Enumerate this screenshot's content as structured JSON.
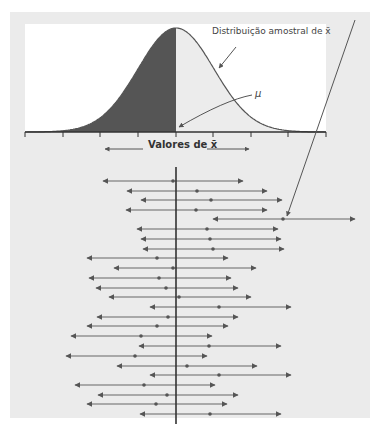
{
  "labels": {
    "dist_label": "Distribuição amostral de x̄",
    "mu_label": "μ",
    "axis_label": "Valores de x̄"
  },
  "colors": {
    "panel": "#ebebeb",
    "curve_box": "#ffffff",
    "shaded": "#555555",
    "unshaded": "#ececec",
    "line": "#555555"
  },
  "curve": {
    "center_x": 176,
    "peak_y": 28,
    "base_y": 132,
    "sigma_px": 38,
    "ticks_x": [
      25,
      63,
      100,
      138,
      176,
      213,
      251,
      288,
      326
    ]
  },
  "mean_line": {
    "x": 176,
    "y1": 167,
    "y2": 424
  },
  "outlier_pointer": {
    "from": [
      355,
      20
    ],
    "to": [
      287,
      216
    ]
  },
  "intervals": [
    {
      "y": 181,
      "left": 103,
      "center": 173,
      "right": 243
    },
    {
      "y": 191,
      "left": 127,
      "center": 197,
      "right": 267
    },
    {
      "y": 200,
      "left": 141,
      "center": 211,
      "right": 282
    },
    {
      "y": 210,
      "left": 126,
      "center": 196,
      "right": 267
    },
    {
      "y": 219,
      "left": 213,
      "center": 283,
      "right": 355
    },
    {
      "y": 229,
      "left": 137,
      "center": 207,
      "right": 278
    },
    {
      "y": 239,
      "left": 141,
      "center": 210,
      "right": 281
    },
    {
      "y": 249,
      "left": 143,
      "center": 213,
      "right": 284
    },
    {
      "y": 258,
      "left": 87,
      "center": 157,
      "right": 228
    },
    {
      "y": 268,
      "left": 114,
      "center": 173,
      "right": 256
    },
    {
      "y": 278,
      "left": 89,
      "center": 159,
      "right": 231
    },
    {
      "y": 288,
      "left": 96,
      "center": 166,
      "right": 238
    },
    {
      "y": 297,
      "left": 109,
      "center": 179,
      "right": 251
    },
    {
      "y": 307,
      "left": 150,
      "center": 219,
      "right": 291
    },
    {
      "y": 317,
      "left": 97,
      "center": 168,
      "right": 238
    },
    {
      "y": 326,
      "left": 87,
      "center": 157,
      "right": 228
    },
    {
      "y": 336,
      "left": 71,
      "center": 141,
      "right": 212
    },
    {
      "y": 346,
      "left": 139,
      "center": 209,
      "right": 281
    },
    {
      "y": 356,
      "left": 66,
      "center": 135,
      "right": 207
    },
    {
      "y": 366,
      "left": 117,
      "center": 187,
      "right": 257
    },
    {
      "y": 375,
      "left": 150,
      "center": 219,
      "right": 291
    },
    {
      "y": 385,
      "left": 75,
      "center": 144,
      "right": 215
    },
    {
      "y": 395,
      "left": 98,
      "center": 167,
      "right": 238
    },
    {
      "y": 404,
      "left": 87,
      "center": 156,
      "right": 227
    },
    {
      "y": 414,
      "left": 140,
      "center": 210,
      "right": 281
    }
  ]
}
